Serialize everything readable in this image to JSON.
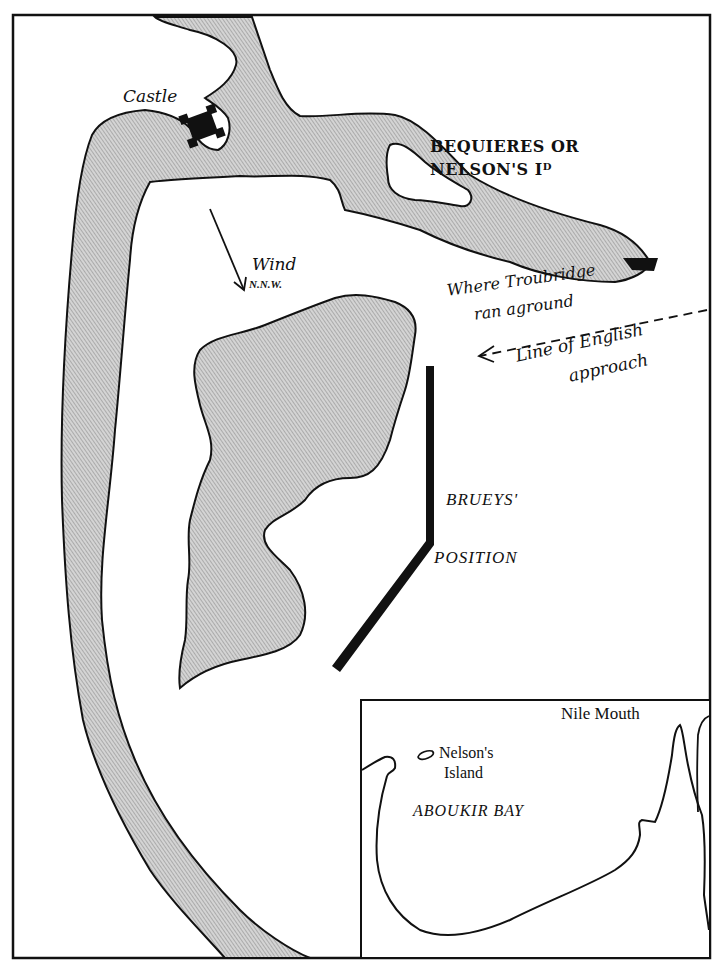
{
  "map": {
    "title_region": "Aboukir Bay (Battle of the Nile)",
    "colors": {
      "ink": "#111111",
      "land_fill": "#c9c9c9",
      "land_hatch": "#8a8a8a",
      "paper": "#ffffff"
    },
    "labels": {
      "castle": "Castle",
      "island_line1": "BEQUIERES OR",
      "island_line2": "NELSON'S Iᴰ",
      "wind": "Wind",
      "wind_direction": "N.N.W.",
      "troubridge_line1": "Where Troubridge",
      "troubridge_line2": "ran aground",
      "approach_line1": "Line of English",
      "approach_line2": "approach",
      "brueys_line1": "BRUEYS'",
      "brueys_line2": "POSITION"
    },
    "inset": {
      "nile_mouth": "Nile Mouth",
      "nelsons_island_line1": "Nelson's",
      "nelsons_island_line2": "Island",
      "bay_name": "ABOUKIR BAY"
    },
    "icons": {
      "castle": "castle-icon",
      "ship": "ship-icon",
      "wind_arrow": "wind-arrow-icon",
      "approach_arrow": "approach-arrow-icon"
    }
  }
}
